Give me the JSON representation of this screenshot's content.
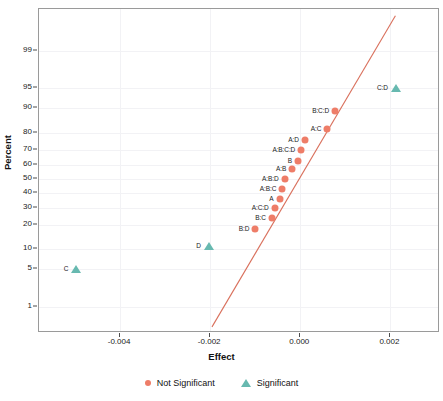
{
  "chart_data": {
    "type": "scatter",
    "title": "",
    "xlabel": "Effect",
    "ylabel": "Percent",
    "grid": true,
    "legend_position": "bottom",
    "xlim": [
      -0.0058,
      0.0031
    ],
    "xticks": [
      -0.004,
      -0.002,
      0.0,
      0.002
    ],
    "xtick_labels": [
      "-0.004",
      "-0.002",
      "0.000",
      "0.002"
    ],
    "ylim_percent": [
      0.25,
      99.9
    ],
    "yticks": [
      1,
      5,
      10,
      20,
      30,
      40,
      50,
      60,
      70,
      80,
      90,
      95,
      99
    ],
    "ytick_labels": [
      "1",
      "5",
      "10",
      "20",
      "30",
      "40",
      "50",
      "60",
      "70",
      "80",
      "90",
      "95",
      "99"
    ],
    "reference_line": {
      "x0": -0.00196,
      "y0_percent": 0.35,
      "x1": 0.00211,
      "y1_percent": 99.85
    },
    "series": [
      {
        "name": "Not Significant",
        "marker": "circle",
        "color": "#EE7D68",
        "points": [
          {
            "label": "B:D",
            "effect": -0.001,
            "percent": 18,
            "label_side": "left"
          },
          {
            "label": "B:C",
            "effect": -0.00063,
            "percent": 24,
            "label_side": "left"
          },
          {
            "label": "A:C:D",
            "effect": -0.00057,
            "percent": 30,
            "label_side": "left"
          },
          {
            "label": "A",
            "effect": -0.00046,
            "percent": 36,
            "label_side": "left"
          },
          {
            "label": "A:B:C",
            "effect": -0.0004,
            "percent": 43,
            "label_side": "left"
          },
          {
            "label": "A:B:D",
            "effect": -0.00035,
            "percent": 50,
            "label_side": "left"
          },
          {
            "label": "A:B",
            "effect": -0.00018,
            "percent": 57,
            "label_side": "left"
          },
          {
            "label": "B",
            "effect": -5e-05,
            "percent": 63,
            "label_side": "left"
          },
          {
            "label": "A:B:C:D",
            "effect": 2e-05,
            "percent": 70,
            "label_side": "left"
          },
          {
            "label": "A:D",
            "effect": 0.0001,
            "percent": 76,
            "label_side": "left"
          },
          {
            "label": "A:C",
            "effect": 0.0006,
            "percent": 82,
            "label_side": "left"
          },
          {
            "label": "B:C:D",
            "effect": 0.00077,
            "percent": 89,
            "label_side": "left"
          }
        ]
      },
      {
        "name": "Significant",
        "marker": "triangle",
        "color": "#67B9B0",
        "points": [
          {
            "label": "C",
            "effect": -0.00497,
            "percent": 5,
            "label_side": "left"
          },
          {
            "label": "D",
            "effect": -0.00203,
            "percent": 11,
            "label_side": "left"
          },
          {
            "label": "C:D",
            "effect": 0.00212,
            "percent": 95,
            "label_side": "left"
          }
        ]
      }
    ]
  },
  "axes": {
    "x_label": "Effect",
    "y_label": "Percent"
  },
  "legend": {
    "entries": [
      {
        "label": "Not Significant",
        "marker": "circle",
        "color": "#EE7D68"
      },
      {
        "label": "Significant",
        "marker": "triangle",
        "color": "#67B9B0"
      }
    ]
  },
  "colors": {
    "not_significant": "#EE7D68",
    "significant": "#67B9B0",
    "reference_line": "#D9705C",
    "panel_border": "#9a9a9a",
    "grid": "#f2f2f5"
  }
}
